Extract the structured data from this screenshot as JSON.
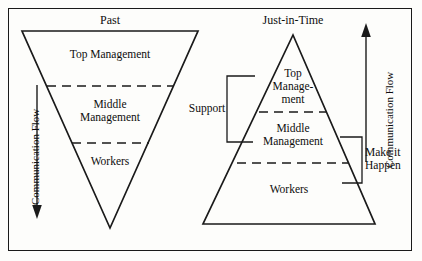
{
  "diagram": {
    "title_left": "Past",
    "title_right": "Just-in-Time",
    "frame_color": "#1a1a1a",
    "background_color": "#fdfdfb",
    "line_color": "#1a1a1a"
  },
  "past_pyramid": {
    "orientation": "inverted",
    "bands": [
      {
        "label": "Top Management"
      },
      {
        "label": "Middle\nManagement"
      },
      {
        "label": "Workers"
      }
    ]
  },
  "jit_pyramid": {
    "orientation": "upright",
    "bands": [
      {
        "label": "Top\nManage-\nment"
      },
      {
        "label": "Middle\nManagement"
      },
      {
        "label": "Workers"
      }
    ]
  },
  "annotations": {
    "flow_left": "Communication Flow",
    "flow_left_direction": "down",
    "flow_right": "Communication Flow",
    "flow_right_direction": "up",
    "support": "Support",
    "make_it_happen": "Make it\nHappen"
  }
}
